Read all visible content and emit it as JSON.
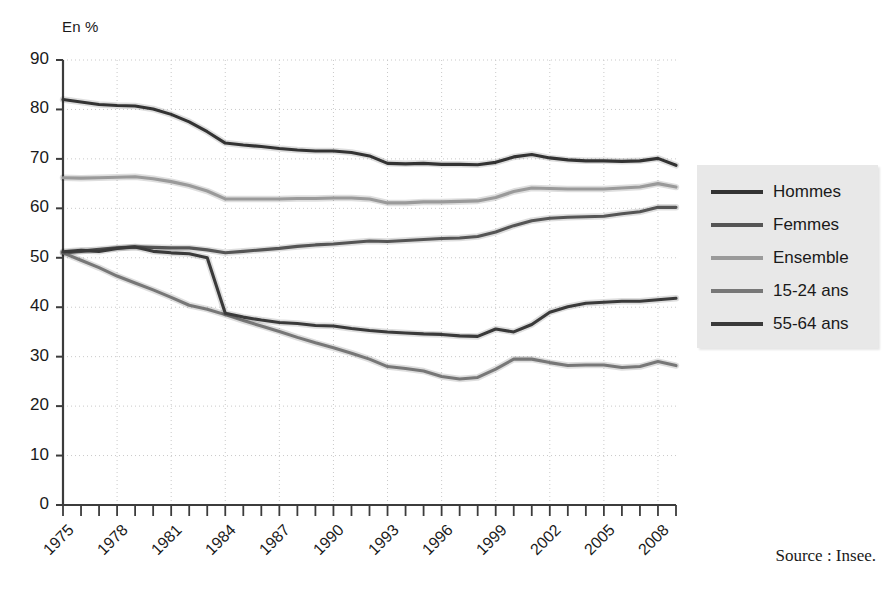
{
  "axis_unit_label": "En %",
  "source": "Source : Insee.",
  "legend": {
    "items": [
      {
        "label": "Hommes",
        "color": "#333333"
      },
      {
        "label": "Femmes",
        "color": "#555555"
      },
      {
        "label": "Ensemble",
        "color": "#9a9a9a"
      },
      {
        "label": "15-24 ans",
        "color": "#777777"
      },
      {
        "label": "55-64 ans",
        "color": "#3a3a3a"
      }
    ]
  },
  "chart_data": {
    "type": "line",
    "title": "",
    "subtitle": "",
    "xlabel": "",
    "ylabel": "En %",
    "xlim": [
      1975,
      2009
    ],
    "ylim": [
      0,
      90
    ],
    "yticks": [
      0,
      10,
      20,
      30,
      40,
      50,
      60,
      70,
      80,
      90
    ],
    "ytick_labels": [
      "0",
      "10",
      "20",
      "30",
      "40",
      "50",
      "60",
      "70",
      "80",
      "90"
    ],
    "xticks": [
      1975,
      1978,
      1981,
      1984,
      1987,
      1990,
      1993,
      1996,
      1999,
      2002,
      2005,
      2008
    ],
    "xtick_labels": [
      "1975",
      "1978",
      "1981",
      "1984",
      "1987",
      "1990",
      "1993",
      "1996",
      "1999",
      "2002",
      "2005",
      "2008"
    ],
    "minor_xticks_every": 1,
    "grid": "dotted-both",
    "legend_position": "right",
    "x": [
      1975,
      1976,
      1977,
      1978,
      1979,
      1980,
      1981,
      1982,
      1983,
      1984,
      1985,
      1986,
      1987,
      1988,
      1989,
      1990,
      1991,
      1992,
      1993,
      1994,
      1995,
      1996,
      1997,
      1998,
      1999,
      2000,
      2001,
      2002,
      2003,
      2004,
      2005,
      2006,
      2007,
      2008,
      2009
    ],
    "series": [
      {
        "name": "Hommes",
        "color": "#333333",
        "values": [
          82.0,
          81.5,
          81.0,
          80.8,
          80.7,
          80.1,
          79.0,
          77.5,
          75.5,
          73.2,
          72.8,
          72.5,
          72.1,
          71.8,
          71.6,
          71.6,
          71.3,
          70.6,
          69.1,
          69.0,
          69.1,
          68.9,
          68.9,
          68.8,
          69.3,
          70.4,
          70.9,
          70.2,
          69.8,
          69.6,
          69.6,
          69.5,
          69.6,
          70.1,
          68.7
        ]
      },
      {
        "name": "Femmes",
        "color": "#555555",
        "values": [
          51.0,
          51.3,
          51.7,
          52.0,
          52.2,
          52.1,
          52.0,
          52.0,
          51.6,
          51.0,
          51.3,
          51.6,
          51.9,
          52.3,
          52.6,
          52.8,
          53.1,
          53.4,
          53.3,
          53.5,
          53.7,
          53.9,
          54.0,
          54.3,
          55.2,
          56.5,
          57.5,
          58.0,
          58.2,
          58.3,
          58.4,
          58.9,
          59.3,
          60.2,
          60.2
        ]
      },
      {
        "name": "Ensemble",
        "color": "#9a9a9a",
        "values": [
          66.2,
          66.1,
          66.2,
          66.3,
          66.4,
          66.0,
          65.4,
          64.6,
          63.5,
          61.9,
          61.9,
          61.9,
          61.9,
          62.0,
          62.0,
          62.1,
          62.1,
          61.9,
          61.1,
          61.1,
          61.3,
          61.3,
          61.4,
          61.5,
          62.2,
          63.4,
          64.1,
          64.0,
          63.9,
          63.9,
          63.9,
          64.1,
          64.3,
          65.0,
          64.3
        ]
      },
      {
        "name": "15-24 ans",
        "color": "#777777",
        "values": [
          51.0,
          49.5,
          48.0,
          46.3,
          44.9,
          43.5,
          42.0,
          40.4,
          39.6,
          38.5,
          37.3,
          36.2,
          35.1,
          33.9,
          32.8,
          31.8,
          30.7,
          29.5,
          28.0,
          27.6,
          27.1,
          26.0,
          25.5,
          25.8,
          27.5,
          29.5,
          29.5,
          28.8,
          28.2,
          28.3,
          28.3,
          27.8,
          28.0,
          29.0,
          28.2
        ]
      },
      {
        "name": "55-64 ans",
        "color": "#3a3a3a",
        "values": [
          51.2,
          51.5,
          51.3,
          51.9,
          52.2,
          51.3,
          51.0,
          50.8,
          50.0,
          38.8,
          38.0,
          37.4,
          36.9,
          36.7,
          36.3,
          36.2,
          35.7,
          35.3,
          35.0,
          34.8,
          34.6,
          34.5,
          34.2,
          34.1,
          35.6,
          35.0,
          36.5,
          39.0,
          40.1,
          40.8,
          41.0,
          41.2,
          41.2,
          41.5,
          41.8
        ]
      }
    ]
  }
}
